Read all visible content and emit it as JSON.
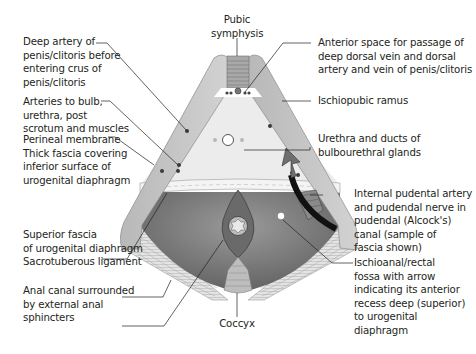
{
  "diagram": {
    "labels": {
      "pubic_symphysis": "Pubic\nsymphysis",
      "deep_artery": "Deep artery of\npenis/clitoris before\nentering crus of\npenis/clitoris",
      "arteries_bulb": "Arteries to bulb,\nurethra, post\nscrotum and muscles",
      "perineal_membrane": "Perineal membrane\nThick fascia covering\ninferior surface of\nurogenital diaphragm",
      "superior_fascia": "Superior fascia\nof urogenital diaphragm",
      "sacrotuberous": "Sacrotuberous ligament",
      "anal_canal": "Anal canal surrounded\nby external anal\nsphincters",
      "coccyx": "Coccyx",
      "anterior_space": "Anterior space for passage of\ndeep dorsal vein and dorsal\nartery and vein of penis/clitoris",
      "ischiopubic_ramus": "Ischiopubic ramus",
      "urethra": "Urethra and ducts of\nbulbourethral glands",
      "internal_pudendal": "Internal pudental artery\nand pudendal nerve in\npudendal (Alcock's)\ncanal (sample of\nfascia shown)",
      "ischioanal_fossa": "Ischioanal/rectal\nfossa with arrow\nindicating its anterior\nrecess deep (superior)\nto urogenital\ndiaphragm"
    },
    "colors": {
      "bone": "#c8c8c8",
      "bone_edge": "#8a8a8a",
      "urogenital_region": "#ececec",
      "anal_region": "#7a7a7a",
      "ligament": "#dcdcdc",
      "vessel_dot": "#3a3a3a",
      "arrow": "#6e6e6e",
      "text": "#231f20"
    }
  }
}
